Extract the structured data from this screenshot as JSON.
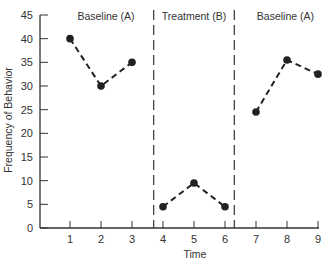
{
  "chart_data": {
    "type": "line",
    "title": "",
    "xlabel": "Time",
    "ylabel": "Frequency of Behavior",
    "x": [
      1,
      2,
      3,
      4,
      5,
      6,
      7,
      8,
      9
    ],
    "xticks": [
      "1",
      "2",
      "3",
      "4",
      "5",
      "6",
      "7",
      "8",
      "9"
    ],
    "yticks": [
      "0",
      "5",
      "10",
      "15",
      "20",
      "25",
      "30",
      "35",
      "40",
      "45"
    ],
    "ylim": [
      0,
      45
    ],
    "xlim": [
      0,
      9
    ],
    "grid": false,
    "phases": [
      {
        "label": "Baseline (A)",
        "x": [
          1,
          2,
          3
        ],
        "values": [
          40,
          30,
          35
        ]
      },
      {
        "label": "Treatment (B)",
        "x": [
          4,
          5,
          6
        ],
        "values": [
          4.5,
          9.5,
          4.5
        ]
      },
      {
        "label": "Baseline (A)",
        "x": [
          7,
          8,
          9
        ],
        "values": [
          24.5,
          35.5,
          32.5
        ]
      }
    ],
    "phase_change_lines_x": [
      3.7,
      6.3
    ],
    "series": [
      {
        "name": "Frequency of Behavior",
        "values": [
          40,
          30,
          35,
          4.5,
          9.5,
          4.5,
          24.5,
          35.5,
          32.5
        ]
      }
    ],
    "style": {
      "line_color": "#222222",
      "line_dash": "dashed",
      "marker": "filled-circle"
    }
  }
}
